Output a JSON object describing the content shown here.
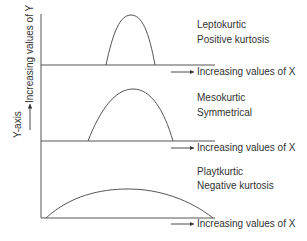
{
  "diagram": {
    "y_axis": {
      "title": "Y-axis",
      "direction_label": "Increasing values of Y"
    },
    "panels": [
      {
        "name": "Leptokurtic",
        "line1": "Leptokurtic",
        "line2": "Positive kurtosis",
        "x_label": "Increasing values of X",
        "shape": "narrow-tall"
      },
      {
        "name": "Mesokurtic",
        "line1": "Mesokurtic",
        "line2": "Symmetrical",
        "x_label": "Increasing values of X",
        "shape": "medium"
      },
      {
        "name": "Platykurtic",
        "line1": "Playtkurtic",
        "line2": "Negative kurtosis",
        "x_label": "Increasing values of X",
        "shape": "wide-flat"
      }
    ],
    "colors": {
      "line": "#555555",
      "text": "#333333",
      "background": "#ffffff"
    }
  }
}
